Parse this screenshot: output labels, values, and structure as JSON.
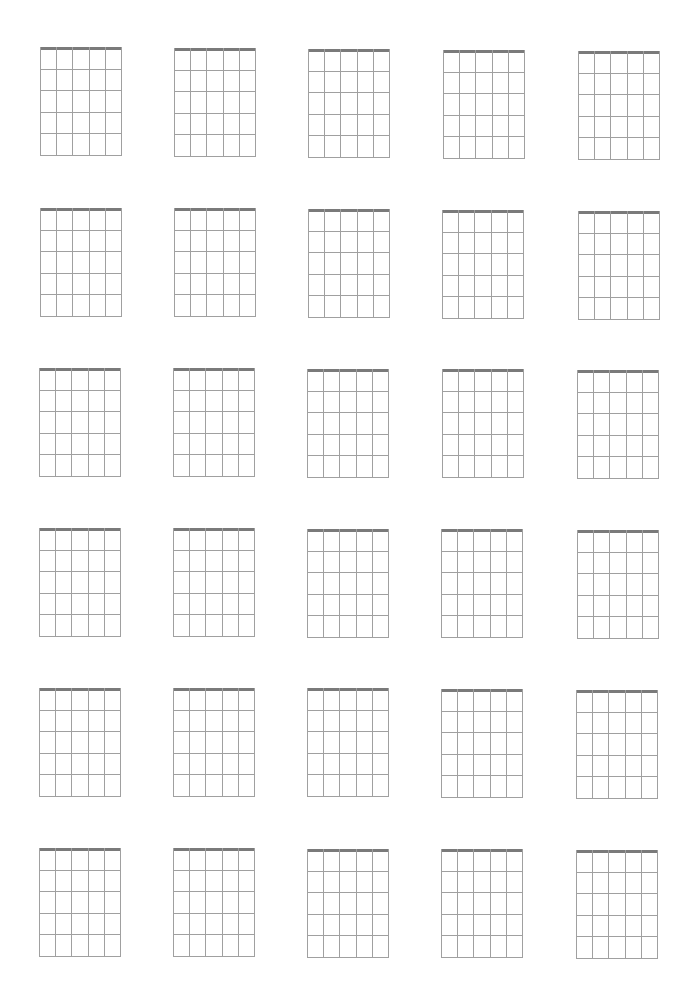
{
  "page": {
    "type": "blank guitar chord chart sheet",
    "background": "#ffffff",
    "rows": 6,
    "columns": 5,
    "diagram": {
      "strings": 6,
      "frets": 5,
      "width_px": 82,
      "height_px": 109,
      "nut_color": "#7a7a7a",
      "line_color": "#a0a0a0"
    },
    "grid_positions": [
      [
        [
          40,
          47
        ],
        [
          174,
          48
        ],
        [
          308,
          49
        ],
        [
          443,
          50
        ],
        [
          578,
          51
        ]
      ],
      [
        [
          40,
          208
        ],
        [
          174,
          208
        ],
        [
          308,
          209
        ],
        [
          442,
          210
        ],
        [
          578,
          211
        ]
      ],
      [
        [
          39,
          368
        ],
        [
          173,
          368
        ],
        [
          307,
          369
        ],
        [
          442,
          369
        ],
        [
          577,
          370
        ]
      ],
      [
        [
          39,
          528
        ],
        [
          173,
          528
        ],
        [
          307,
          529
        ],
        [
          441,
          529
        ],
        [
          577,
          530
        ]
      ],
      [
        [
          39,
          688
        ],
        [
          173,
          688
        ],
        [
          307,
          688
        ],
        [
          441,
          689
        ],
        [
          576,
          690
        ]
      ],
      [
        [
          39,
          848
        ],
        [
          173,
          848
        ],
        [
          307,
          849
        ],
        [
          441,
          849
        ],
        [
          576,
          850
        ]
      ]
    ]
  }
}
